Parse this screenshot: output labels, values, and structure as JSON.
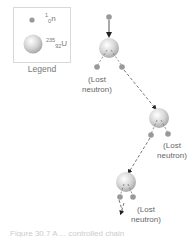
{
  "legend": {
    "title": "Legend",
    "items": [
      {
        "name": "neutron",
        "mass": "1",
        "atomic": "0",
        "symbol": "n"
      },
      {
        "name": "uranium-235",
        "mass": "235",
        "atomic": "92",
        "symbol": "U"
      }
    ]
  },
  "labels": {
    "lost1_line1": "(Lost",
    "lost1_line2": "neutron)",
    "lost2_line1": "(Lost",
    "lost2_line2": "neutron)",
    "lost3_line1": "(Lost",
    "lost3_line2": "neutron)"
  },
  "caption": "Figure 30.7 A ... controlled chain"
}
